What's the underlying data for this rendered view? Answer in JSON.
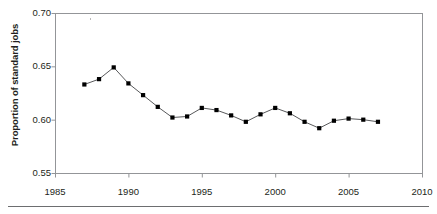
{
  "chart_data": {
    "type": "line",
    "title": "",
    "xlabel": "",
    "ylabel": "Proportion of standard jobs",
    "xlim": [
      1985,
      2010
    ],
    "ylim": [
      0.55,
      0.7
    ],
    "xticks": [
      1985,
      1990,
      1995,
      2000,
      2005,
      2010
    ],
    "xtick_labels": [
      "1985",
      "1990",
      "1995",
      "2000",
      "2005",
      "2010"
    ],
    "yticks": [
      0.55,
      0.6,
      0.65,
      0.7
    ],
    "ytick_labels": [
      "0.55",
      "0.60",
      "0.65",
      "0.70"
    ],
    "grid": false,
    "legend": null,
    "marker": "square",
    "marker_color": "#000000",
    "line_color": "#58595b",
    "axis_color": "#939598",
    "x": [
      1987,
      1988,
      1989,
      1990,
      1991,
      1992,
      1993,
      1994,
      1995,
      1996,
      1997,
      1998,
      1999,
      2000,
      2001,
      2002,
      2003,
      2004,
      2005,
      2006,
      2007
    ],
    "values": [
      0.633,
      0.638,
      0.649,
      0.634,
      0.623,
      0.612,
      0.602,
      0.603,
      0.611,
      0.609,
      0.604,
      0.598,
      0.605,
      0.611,
      0.606,
      0.598,
      0.592,
      0.599,
      0.601,
      0.6,
      0.598
    ],
    "series": [
      {
        "name": "Proportion of standard jobs",
        "values": [
          0.633,
          0.638,
          0.649,
          0.634,
          0.623,
          0.612,
          0.602,
          0.603,
          0.611,
          0.609,
          0.604,
          0.598,
          0.605,
          0.611,
          0.606,
          0.598,
          0.592,
          0.599,
          0.601,
          0.6,
          0.598
        ]
      }
    ]
  }
}
